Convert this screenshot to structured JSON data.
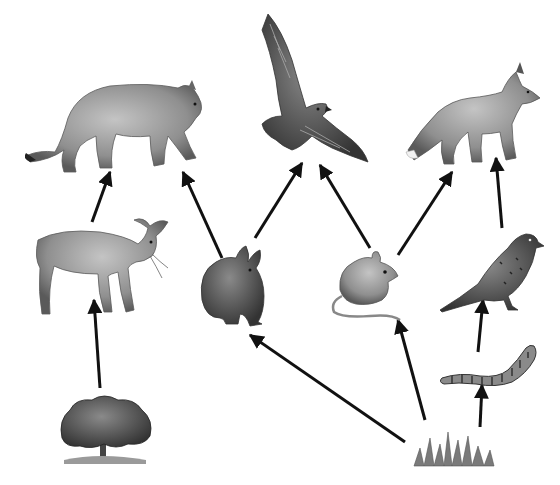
{
  "diagram": {
    "type": "food-web",
    "style": "grayscale illustrations connected by arrows (arrow points from food to consumer)",
    "colors": {
      "background": "#ffffff",
      "arrow": "#111111",
      "fur_light": "#b5b5b5",
      "fur_mid": "#8a8a8a",
      "fur_dark": "#4a4a4a"
    },
    "organisms": [
      {
        "id": "cougar",
        "name": "Cougar",
        "role": "tertiary consumer",
        "x": 25,
        "y": 58,
        "w": 185,
        "h": 115
      },
      {
        "id": "hawk",
        "name": "Hawk",
        "role": "tertiary consumer",
        "x": 258,
        "y": 12,
        "w": 110,
        "h": 165
      },
      {
        "id": "fox",
        "name": "Fox",
        "role": "tertiary consumer",
        "x": 405,
        "y": 65,
        "w": 140,
        "h": 100
      },
      {
        "id": "deer",
        "name": "Deer",
        "role": "primary consumer",
        "x": 30,
        "y": 218,
        "w": 140,
        "h": 100
      },
      {
        "id": "rabbit",
        "name": "Rabbit",
        "role": "primary consumer",
        "x": 195,
        "y": 245,
        "w": 75,
        "h": 90
      },
      {
        "id": "mouse",
        "name": "Mouse",
        "role": "primary consumer",
        "x": 328,
        "y": 250,
        "w": 75,
        "h": 75
      },
      {
        "id": "sparrow",
        "name": "Sparrow",
        "role": "secondary consumer",
        "x": 438,
        "y": 228,
        "w": 105,
        "h": 85
      },
      {
        "id": "caterpillar",
        "name": "Caterpillar",
        "role": "primary consumer",
        "x": 440,
        "y": 345,
        "w": 105,
        "h": 45
      },
      {
        "id": "tree",
        "name": "Tree",
        "role": "producer",
        "x": 60,
        "y": 395,
        "w": 95,
        "h": 70
      },
      {
        "id": "grass",
        "name": "Grass",
        "role": "producer",
        "x": 410,
        "y": 428,
        "w": 85,
        "h": 40
      }
    ],
    "arrows": [
      {
        "from": "deer",
        "to": "cougar",
        "x1": 92,
        "y1": 222,
        "x2": 110,
        "y2": 172
      },
      {
        "from": "rabbit",
        "to": "cougar",
        "x1": 222,
        "y1": 258,
        "x2": 183,
        "y2": 172
      },
      {
        "from": "rabbit",
        "to": "hawk",
        "x1": 255,
        "y1": 238,
        "x2": 302,
        "y2": 163
      },
      {
        "from": "mouse",
        "to": "hawk",
        "x1": 370,
        "y1": 248,
        "x2": 320,
        "y2": 165
      },
      {
        "from": "mouse",
        "to": "fox",
        "x1": 398,
        "y1": 255,
        "x2": 452,
        "y2": 172
      },
      {
        "from": "sparrow",
        "to": "fox",
        "x1": 502,
        "y1": 228,
        "x2": 496,
        "y2": 158
      },
      {
        "from": "tree",
        "to": "deer",
        "x1": 100,
        "y1": 388,
        "x2": 94,
        "y2": 300
      },
      {
        "from": "grass",
        "to": "rabbit",
        "x1": 405,
        "y1": 442,
        "x2": 250,
        "y2": 335
      },
      {
        "from": "grass",
        "to": "mouse",
        "x1": 425,
        "y1": 420,
        "x2": 398,
        "y2": 320
      },
      {
        "from": "caterpillar",
        "to": "sparrow",
        "x1": 478,
        "y1": 352,
        "x2": 483,
        "y2": 300
      },
      {
        "from": "grass",
        "to": "caterpillar",
        "x1": 480,
        "y1": 427,
        "x2": 482,
        "y2": 385
      }
    ]
  }
}
